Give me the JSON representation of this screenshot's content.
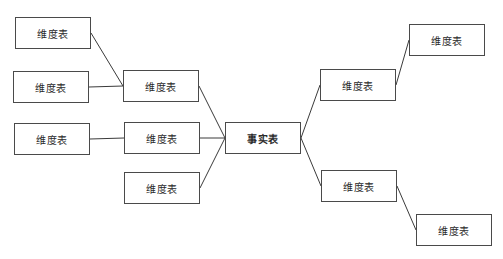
{
  "diagram": {
    "type": "star-schema",
    "nodes": [
      {
        "id": "l1",
        "label": "维度表",
        "kind": "dimension"
      },
      {
        "id": "l2",
        "label": "维度表",
        "kind": "dimension"
      },
      {
        "id": "l3",
        "label": "维度表",
        "kind": "dimension"
      },
      {
        "id": "m1",
        "label": "维度表",
        "kind": "dimension"
      },
      {
        "id": "m2",
        "label": "维度表",
        "kind": "dimension"
      },
      {
        "id": "m3",
        "label": "维度表",
        "kind": "dimension"
      },
      {
        "id": "f",
        "label": "事实表",
        "kind": "fact"
      },
      {
        "id": "r1",
        "label": "维度表",
        "kind": "dimension"
      },
      {
        "id": "r2",
        "label": "维度表",
        "kind": "dimension"
      },
      {
        "id": "rr1",
        "label": "维度表",
        "kind": "dimension"
      },
      {
        "id": "rr2",
        "label": "维度表",
        "kind": "dimension"
      }
    ],
    "edges": [
      {
        "from": "l1",
        "to": "m1"
      },
      {
        "from": "l2",
        "to": "m1"
      },
      {
        "from": "l3",
        "to": "m2"
      },
      {
        "from": "m1",
        "to": "f"
      },
      {
        "from": "m2",
        "to": "f"
      },
      {
        "from": "m3",
        "to": "f"
      },
      {
        "from": "f",
        "to": "r1"
      },
      {
        "from": "f",
        "to": "r2"
      },
      {
        "from": "r1",
        "to": "rr1"
      },
      {
        "from": "r2",
        "to": "rr2"
      }
    ]
  }
}
